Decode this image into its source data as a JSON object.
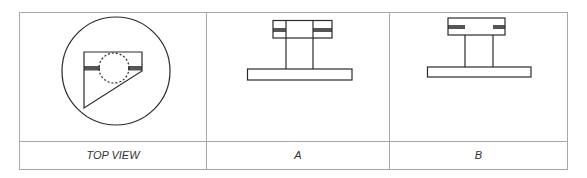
{
  "diagram": {
    "type": "orthographic-views-table",
    "colors": {
      "grid_line": "#a8a8a8",
      "stroke": "#2a2a2a",
      "band_fill": "#555555",
      "background": "#ffffff"
    },
    "columns": [
      {
        "id": "top-view",
        "label": "TOP VIEW"
      },
      {
        "id": "a",
        "label": "A"
      },
      {
        "id": "b",
        "label": "B"
      }
    ]
  }
}
